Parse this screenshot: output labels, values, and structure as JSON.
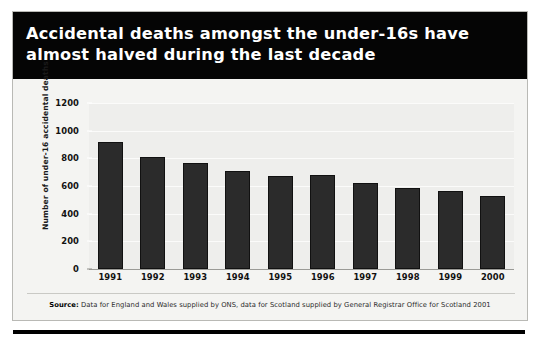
{
  "title": "Accidental deaths amongst the under-16s have\nalmost halved during the last decade",
  "source": {
    "prefix": "Source:",
    "text": " Data for England and Wales supplied by ONS, data for Scotland supplied by General Registrar Office for Scotland 2001"
  },
  "colors": {
    "banner_background": "#050505",
    "banner_text": "#ffffff",
    "card_background": "#f2f2f0",
    "plot_background": "#eeeeec",
    "bar": "#2b2b2b",
    "gridline": "#fbfbfa",
    "axis": "#9a9a96"
  },
  "chart_data": {
    "type": "bar",
    "title": "Accidental deaths amongst the under-16s have almost halved during the last decade",
    "xlabel": "",
    "ylabel": "Number of under-16 accidental deaths",
    "categories": [
      "1991",
      "1992",
      "1993",
      "1994",
      "1995",
      "1996",
      "1997",
      "1998",
      "1999",
      "2000"
    ],
    "values": [
      915,
      810,
      765,
      705,
      675,
      680,
      620,
      585,
      565,
      525
    ],
    "ylim": [
      0,
      1200
    ],
    "yticks": [
      0,
      200,
      400,
      600,
      800,
      1000,
      1200
    ],
    "ytick_labels": [
      "0",
      "200",
      "400",
      "600",
      "800",
      "1000",
      "1200"
    ],
    "grid": true,
    "legend": false
  }
}
